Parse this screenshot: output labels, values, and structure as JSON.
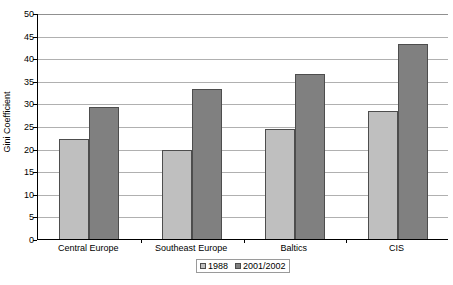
{
  "chart_data": {
    "type": "bar",
    "title": "",
    "subtitle": "",
    "xlabel": "",
    "ylabel": "Gini Coefficient",
    "categories": [
      "Central Europe",
      "Southeast Europe",
      "Baltics",
      "CIS"
    ],
    "series": [
      {
        "name": "1988",
        "color": "#bfbfbf",
        "values": [
          22.2,
          19.7,
          24.3,
          28.4
        ]
      },
      {
        "name": "2001/2002",
        "color": "#808080",
        "values": [
          29.1,
          33.1,
          36.6,
          43.1
        ]
      }
    ],
    "ylim": [
      0,
      50
    ],
    "ytick_step": 5,
    "ytick_labels": [
      "0",
      "5",
      "10",
      "15",
      "20",
      "25",
      "30",
      "35",
      "40",
      "45",
      "50"
    ],
    "grid": "horizontal",
    "legend_position": "bottom-center",
    "plot_border": "left-and-bottom",
    "axis_color": "#000000",
    "gridline_color": "#b0b0b0",
    "background": "#ffffff"
  },
  "axes": {
    "y_title": "Gini Coefficient"
  },
  "legend": {
    "entries": [
      {
        "label": "1988"
      },
      {
        "label": "2001/2002"
      }
    ]
  }
}
